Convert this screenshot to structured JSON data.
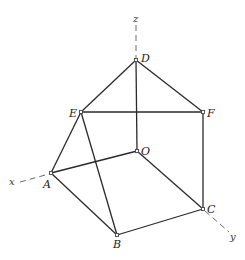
{
  "diagram": {
    "type": "3d-wireframe-solid",
    "axes": {
      "x": {
        "label": "x"
      },
      "y": {
        "label": "y"
      },
      "z": {
        "label": "z"
      }
    },
    "vertices": {
      "O": {
        "label": "O"
      },
      "A": {
        "label": "A"
      },
      "B": {
        "label": "B"
      },
      "C": {
        "label": "C"
      },
      "D": {
        "label": "D"
      },
      "E": {
        "label": "E"
      },
      "F": {
        "label": "F"
      }
    },
    "edges": [
      [
        "D",
        "E"
      ],
      [
        "D",
        "F"
      ],
      [
        "D",
        "O"
      ],
      [
        "E",
        "F"
      ],
      [
        "E",
        "A"
      ],
      [
        "E",
        "B"
      ],
      [
        "F",
        "C"
      ],
      [
        "O",
        "A"
      ],
      [
        "O",
        "C"
      ],
      [
        "A",
        "B"
      ],
      [
        "B",
        "C"
      ]
    ]
  }
}
